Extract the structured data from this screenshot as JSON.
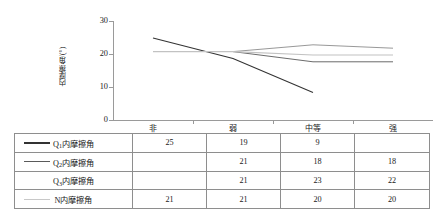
{
  "chart_data": {
    "type": "line",
    "title": "",
    "xlabel": "",
    "ylabel": "内摩擦角/(°)",
    "categories": [
      "非",
      "弱",
      "中等",
      "强"
    ],
    "ylim": [
      0,
      30
    ],
    "yticks": [
      0,
      10,
      20,
      30
    ],
    "grid": false,
    "legend": "data-table-below",
    "series": [
      {
        "name": "Q₁内摩擦角",
        "label_base": "Q",
        "label_sub": "1",
        "label_rest": "内摩擦角",
        "color": "#333333",
        "width": 1.1,
        "values": [
          25,
          19,
          9,
          null
        ]
      },
      {
        "name": "Q₂内摩擦角",
        "label_base": "Q",
        "label_sub": "2",
        "label_rest": "内摩擦角",
        "color": "#5a5a5a",
        "width": 0.9,
        "values": [
          null,
          21,
          18,
          18
        ]
      },
      {
        "name": "Q₃内摩擦角",
        "label_base": "Q",
        "label_sub": "3",
        "label_rest": "内摩擦角",
        "color": "#8c8c8c",
        "width": 0.9,
        "values": [
          null,
          21,
          23,
          22
        ]
      },
      {
        "name": "N内摩擦角",
        "label_base": "N",
        "label_sub": "",
        "label_rest": "内摩擦角",
        "color": "#c2c2c2",
        "width": 1.2,
        "values": [
          21,
          21,
          20,
          20
        ]
      }
    ]
  },
  "axis": {
    "y_ticks": [
      "30",
      "20",
      "10",
      "0"
    ],
    "x_categories": [
      "非",
      "弱",
      "中等",
      "强"
    ],
    "y_axis_title": "内摩擦角/(°)"
  },
  "table": {
    "rows": [
      {
        "label_base": "Q",
        "label_sub": "1",
        "label_rest": "内摩擦角",
        "swatch_color": "#333333",
        "swatch_height": "1.5px",
        "show_swatch": true,
        "cells": [
          "25",
          "19",
          "9",
          ""
        ]
      },
      {
        "label_base": "Q",
        "label_sub": "2",
        "label_rest": "内摩擦角",
        "swatch_color": "#5a5a5a",
        "swatch_height": "1.1px",
        "show_swatch": true,
        "cells": [
          "",
          "21",
          "18",
          "18"
        ]
      },
      {
        "label_base": "Q",
        "label_sub": "3",
        "label_rest": "内摩擦角",
        "swatch_color": "#9a9a9a",
        "swatch_height": "0.8px",
        "show_swatch": false,
        "cells": [
          "",
          "21",
          "23",
          "22"
        ]
      },
      {
        "label_base": "N",
        "label_sub": "",
        "label_rest": "内摩擦角",
        "swatch_color": "#c8c8c8",
        "swatch_height": "1.5px",
        "show_swatch": true,
        "cells": [
          "21",
          "21",
          "20",
          "20"
        ]
      }
    ]
  },
  "colors": {
    "axis": "#9a9a9a",
    "border": "#8e8e8e",
    "text": "#1a1a1a",
    "background": "#ffffff"
  }
}
